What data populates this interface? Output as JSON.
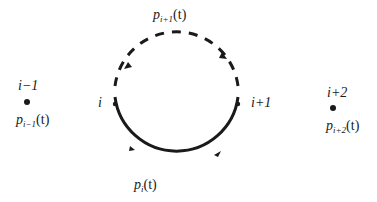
{
  "diagram": {
    "type": "state-cycle",
    "nodes": [
      {
        "id": "i-1",
        "label": "i−1",
        "prob_base": "p",
        "prob_sub": "i−1",
        "prob_arg": "(t)",
        "isolated": true
      },
      {
        "id": "i",
        "label": "i",
        "on_cycle": true
      },
      {
        "id": "i+1",
        "label": "i+1",
        "on_cycle": true
      },
      {
        "id": "i+2",
        "label": "i+2",
        "prob_base": "p",
        "prob_sub": "i+2",
        "prob_arg": "(t)",
        "isolated": true
      }
    ],
    "arcs": [
      {
        "from": "i",
        "to": "i+1",
        "style": "solid",
        "path": "lower-semicircle",
        "label_base": "p",
        "label_sub": "i",
        "label_arg": "(t)"
      },
      {
        "from": "i+1",
        "to": "i",
        "style": "dashed",
        "path": "upper-semicircle",
        "label_base": "p",
        "label_sub": "i+1",
        "label_arg": "(t)"
      }
    ],
    "colors": {
      "stroke": "#1a1a1a",
      "background": "#ffffff"
    }
  }
}
